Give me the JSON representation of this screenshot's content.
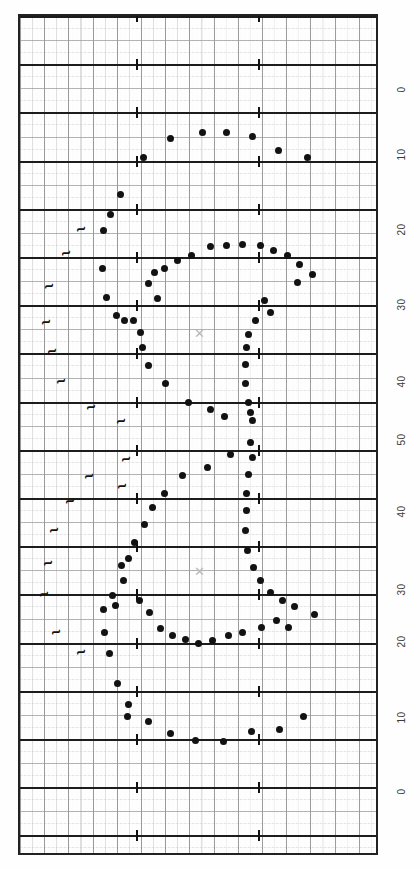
{
  "chart_data": {
    "type": "scatter",
    "title": "",
    "subtitle": "",
    "orientation": "rotated-90",
    "xlabel": "",
    "ylabel": "",
    "grid": true,
    "legend": "none",
    "axis_right": {
      "tick_labels": [
        "0",
        "10",
        "20",
        "30",
        "40",
        "50",
        "40",
        "30",
        "20",
        "10",
        "0"
      ],
      "tick_positions_px": [
        90,
        155,
        230,
        305,
        382,
        440,
        512,
        590,
        642,
        718,
        792
      ],
      "note": "symmetric scale rising 0-50 then falling 50-0"
    },
    "x": [
      118,
      126,
      134,
      142,
      150,
      158,
      166,
      174,
      182,
      190,
      198,
      206,
      214,
      222,
      230,
      238,
      246,
      254,
      262,
      270,
      278,
      286,
      294,
      302,
      310
    ],
    "series": [
      {
        "name": "trace",
        "points": [
          [
            168,
            136
          ],
          [
            200,
            130
          ],
          [
            224,
            130
          ],
          [
            250,
            134
          ],
          [
            276,
            148
          ],
          [
            305,
            155
          ],
          [
            141,
            155
          ],
          [
            118,
            192
          ],
          [
            108,
            212
          ],
          [
            101,
            228
          ],
          [
            100,
            266
          ],
          [
            104,
            295
          ],
          [
            114,
            313
          ],
          [
            122,
            318
          ],
          [
            138,
            362
          ],
          [
            131,
            338
          ],
          [
            118,
            344
          ],
          [
            112,
            318
          ],
          [
            140,
            340
          ],
          [
            163,
            381
          ],
          [
            186,
            400
          ],
          [
            208,
            407
          ],
          [
            180,
            473
          ],
          [
            162,
            491
          ],
          [
            144,
            514
          ],
          [
            126,
            556
          ],
          [
            119,
            563
          ],
          [
            121,
            581
          ],
          [
            109,
            604
          ],
          [
            100,
            630
          ],
          [
            106,
            651
          ],
          [
            120,
            680
          ],
          [
            129,
            700
          ],
          [
            140,
            719
          ],
          [
            168,
            731
          ],
          [
            193,
            738
          ],
          [
            221,
            739
          ],
          [
            252,
            729
          ],
          [
            277,
            727
          ],
          [
            301,
            714
          ]
        ]
      }
    ],
    "markers": [
      {
        "label": "x",
        "x": 197,
        "y": 332
      },
      {
        "label": "x",
        "x": 197,
        "y": 570
      }
    ]
  },
  "chart": {
    "points": [
      {
        "x": 168,
        "y": 136
      },
      {
        "x": 200,
        "y": 130
      },
      {
        "x": 224,
        "y": 130
      },
      {
        "x": 250,
        "y": 134
      },
      {
        "x": 276,
        "y": 148
      },
      {
        "x": 305,
        "y": 155
      },
      {
        "x": 141,
        "y": 155
      },
      {
        "x": 118,
        "y": 192
      },
      {
        "x": 108,
        "y": 212
      },
      {
        "x": 101,
        "y": 228
      },
      {
        "x": 189,
        "y": 253
      },
      {
        "x": 208,
        "y": 244
      },
      {
        "x": 224,
        "y": 243
      },
      {
        "x": 240,
        "y": 242
      },
      {
        "x": 258,
        "y": 243
      },
      {
        "x": 271,
        "y": 248
      },
      {
        "x": 285,
        "y": 253
      },
      {
        "x": 175,
        "y": 258
      },
      {
        "x": 162,
        "y": 266
      },
      {
        "x": 297,
        "y": 262
      },
      {
        "x": 152,
        "y": 270
      },
      {
        "x": 310,
        "y": 272
      },
      {
        "x": 295,
        "y": 280
      },
      {
        "x": 100,
        "y": 266
      },
      {
        "x": 104,
        "y": 295
      },
      {
        "x": 146,
        "y": 281
      },
      {
        "x": 155,
        "y": 296
      },
      {
        "x": 114,
        "y": 313
      },
      {
        "x": 122,
        "y": 318
      },
      {
        "x": 262,
        "y": 298
      },
      {
        "x": 268,
        "y": 310
      },
      {
        "x": 131,
        "y": 318
      },
      {
        "x": 138,
        "y": 330
      },
      {
        "x": 253,
        "y": 318
      },
      {
        "x": 246,
        "y": 332
      },
      {
        "x": 244,
        "y": 345
      },
      {
        "x": 140,
        "y": 345
      },
      {
        "x": 146,
        "y": 363
      },
      {
        "x": 243,
        "y": 362
      },
      {
        "x": 163,
        "y": 381
      },
      {
        "x": 243,
        "y": 381
      },
      {
        "x": 186,
        "y": 400
      },
      {
        "x": 246,
        "y": 400
      },
      {
        "x": 208,
        "y": 407
      },
      {
        "x": 248,
        "y": 410
      },
      {
        "x": 222,
        "y": 414
      },
      {
        "x": 250,
        "y": 418
      },
      {
        "x": 248,
        "y": 440
      },
      {
        "x": 228,
        "y": 452
      },
      {
        "x": 250,
        "y": 455
      },
      {
        "x": 205,
        "y": 465
      },
      {
        "x": 180,
        "y": 473
      },
      {
        "x": 246,
        "y": 472
      },
      {
        "x": 162,
        "y": 491
      },
      {
        "x": 244,
        "y": 491
      },
      {
        "x": 150,
        "y": 505
      },
      {
        "x": 244,
        "y": 508
      },
      {
        "x": 142,
        "y": 522
      },
      {
        "x": 243,
        "y": 528
      },
      {
        "x": 132,
        "y": 540
      },
      {
        "x": 126,
        "y": 556
      },
      {
        "x": 245,
        "y": 548
      },
      {
        "x": 119,
        "y": 563
      },
      {
        "x": 251,
        "y": 565
      },
      {
        "x": 121,
        "y": 578
      },
      {
        "x": 258,
        "y": 578
      },
      {
        "x": 110,
        "y": 593
      },
      {
        "x": 268,
        "y": 590
      },
      {
        "x": 113,
        "y": 603
      },
      {
        "x": 280,
        "y": 598
      },
      {
        "x": 101,
        "y": 607
      },
      {
        "x": 292,
        "y": 604
      },
      {
        "x": 137,
        "y": 598
      },
      {
        "x": 312,
        "y": 612
      },
      {
        "x": 147,
        "y": 610
      },
      {
        "x": 158,
        "y": 626
      },
      {
        "x": 286,
        "y": 625
      },
      {
        "x": 170,
        "y": 633
      },
      {
        "x": 183,
        "y": 637
      },
      {
        "x": 196,
        "y": 641
      },
      {
        "x": 210,
        "y": 638
      },
      {
        "x": 226,
        "y": 633
      },
      {
        "x": 240,
        "y": 630
      },
      {
        "x": 259,
        "y": 625
      },
      {
        "x": 274,
        "y": 618
      },
      {
        "x": 102,
        "y": 630
      },
      {
        "x": 107,
        "y": 651
      },
      {
        "x": 115,
        "y": 681
      },
      {
        "x": 126,
        "y": 702
      },
      {
        "x": 125,
        "y": 714
      },
      {
        "x": 146,
        "y": 719
      },
      {
        "x": 168,
        "y": 731
      },
      {
        "x": 193,
        "y": 738
      },
      {
        "x": 221,
        "y": 739
      },
      {
        "x": 249,
        "y": 729
      },
      {
        "x": 277,
        "y": 727
      },
      {
        "x": 301,
        "y": 714
      }
    ],
    "event_marks": [
      {
        "x": 77,
        "y": 224
      },
      {
        "x": 62,
        "y": 248
      },
      {
        "x": 45,
        "y": 281
      },
      {
        "x": 42,
        "y": 317
      },
      {
        "x": 48,
        "y": 346
      },
      {
        "x": 57,
        "y": 376
      },
      {
        "x": 87,
        "y": 402
      },
      {
        "x": 117,
        "y": 416
      },
      {
        "x": 122,
        "y": 454
      },
      {
        "x": 118,
        "y": 481
      },
      {
        "x": 85,
        "y": 471
      },
      {
        "x": 66,
        "y": 496
      },
      {
        "x": 50,
        "y": 525
      },
      {
        "x": 44,
        "y": 558
      },
      {
        "x": 40,
        "y": 589
      },
      {
        "x": 52,
        "y": 627
      },
      {
        "x": 77,
        "y": 647
      }
    ],
    "x_markers": [
      {
        "x": 197,
        "y": 332
      },
      {
        "x": 197,
        "y": 570
      }
    ],
    "axis_labels": [
      {
        "text": "0",
        "y": 90
      },
      {
        "text": "10",
        "y": 155
      },
      {
        "text": "20",
        "y": 230
      },
      {
        "text": "30",
        "y": 305
      },
      {
        "text": "40",
        "y": 382
      },
      {
        "text": "50",
        "y": 440
      },
      {
        "text": "40",
        "y": 512
      },
      {
        "text": "30",
        "y": 590
      },
      {
        "text": "20",
        "y": 642
      },
      {
        "text": "10",
        "y": 718
      },
      {
        "text": "0",
        "y": 792
      }
    ],
    "tick_columns": [
      134,
      256
    ],
    "point_glyph": "●",
    "event_glyph": "ʅ",
    "marker_glyph": "✕",
    "colors": {
      "point": "#121212",
      "grid_major": "#1c1c1c",
      "grid_minor": "#8d8d8d",
      "frame": "#222222",
      "marker": "#b9b9b9",
      "background": "#fdfdfd"
    }
  }
}
